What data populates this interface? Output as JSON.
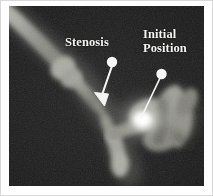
{
  "figure": {
    "type": "grayscale-angiogram",
    "modality_appearance": "x-ray angiogram / vascular phantom, dark field with bright tubular vessel structures",
    "panel": {
      "background_color": "#181818",
      "border_color": "#d8d8d8",
      "width_px": 195,
      "height_px": 180
    }
  },
  "annotations": [
    {
      "id": "stenosis",
      "label": "Stenosis",
      "label_lines": [
        "Stenosis"
      ],
      "color": "#f4f4f2",
      "marker": "dot-with-arrow-leader",
      "dot_center": {
        "x": 112,
        "y": 62
      },
      "dot_radius": 5,
      "arrow_tip": {
        "x": 100,
        "y": 101
      },
      "points_to": "narrowed segment of the vessel below the label"
    },
    {
      "id": "initial-position",
      "label": "Initial Position",
      "label_lines": [
        "Initial",
        "Position"
      ],
      "color": "#f4f4f2",
      "marker": "dot-with-line-leader",
      "dot_center": {
        "x": 161,
        "y": 74
      },
      "dot_radius": 5,
      "leader_end": {
        "x": 141,
        "y": 116
      },
      "points_to": "bright spot at the vessel junction on the right"
    }
  ],
  "features": [
    {
      "name": "upper-left-vessel",
      "description": "broad diagonal vessel entering from top-left corner"
    },
    {
      "name": "vessel-bulge",
      "description": "rounded bulge / nodule on the diagonal vessel"
    },
    {
      "name": "stenotic-segment",
      "description": "narrowed vessel segment mid-frame"
    },
    {
      "name": "lower-branch",
      "description": "short vessel branch descending to bottom-center"
    },
    {
      "name": "bright-spot",
      "description": "high-intensity white blob marking the initial position"
    },
    {
      "name": "right-vessel-loop",
      "description": "looping vessel structure on the right side"
    }
  ],
  "colors": {
    "background": "#181818",
    "annotation": "#f4f4f2",
    "vessel_bright": "#d9d9d4",
    "vessel_mid": "#8e8e88",
    "vessel_dim": "#4a4a46",
    "page": "#ffffff"
  }
}
